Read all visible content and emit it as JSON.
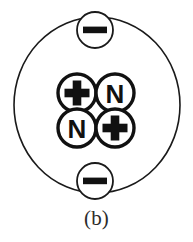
{
  "figure": {
    "caption": "(b)",
    "background_color": "#ffffff",
    "stroke_color": "#1a1a1a",
    "glyph_color": "#111111"
  },
  "orbit": {
    "label": "electron-orbit",
    "center_x": 97,
    "center_y": 105,
    "radius_x": 83,
    "radius_y": 88,
    "stroke_width": 1.6
  },
  "electrons": [
    {
      "id": "electron-top",
      "symbol": "−",
      "charge": "negative",
      "cx": 95,
      "cy": 30,
      "r": 18
    },
    {
      "id": "electron-bottom",
      "symbol": "−",
      "charge": "negative",
      "cx": 95,
      "cy": 181,
      "r": 18
    }
  ],
  "nucleus": {
    "label": "nucleus",
    "particle_count": 4,
    "proton_count": 2,
    "neutron_count": 2,
    "particles": [
      {
        "id": "nucleon-proton-top-left",
        "symbol": "+",
        "kind": "proton",
        "cx": 77,
        "cy": 93,
        "r": 19
      },
      {
        "id": "nucleon-neutron-top-right",
        "symbol": "N",
        "kind": "neutron",
        "cx": 115,
        "cy": 93,
        "r": 19
      },
      {
        "id": "nucleon-neutron-bottom-left",
        "symbol": "N",
        "kind": "neutron",
        "cx": 77,
        "cy": 128,
        "r": 19
      },
      {
        "id": "nucleon-proton-bottom-right",
        "symbol": "+",
        "kind": "proton",
        "cx": 115,
        "cy": 128,
        "r": 19
      }
    ]
  }
}
